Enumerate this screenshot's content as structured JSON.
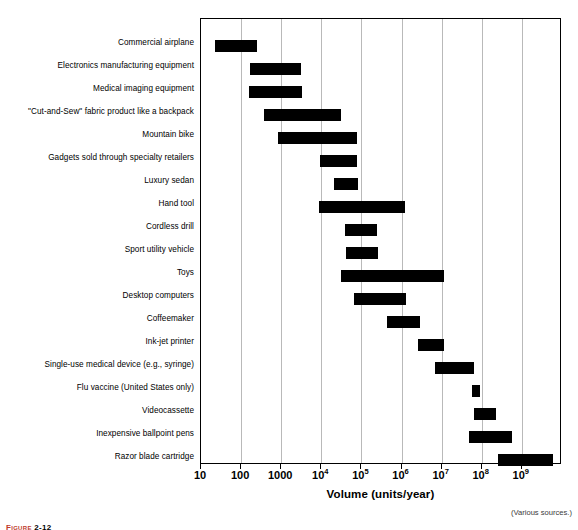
{
  "chart_data": {
    "type": "bar",
    "orientation": "horizontal",
    "subtype": "range-bar",
    "title": "",
    "xlabel": "Volume (units/year)",
    "ylabel": "",
    "xscale": "log",
    "xlim": [
      10,
      3000000000
    ],
    "grid": "vertical-gridlines-at-decades",
    "legend": "none",
    "annotations": [
      "(Various sources.)"
    ],
    "xticks": [
      {
        "value": 10,
        "label": "10",
        "exp": null
      },
      {
        "value": 100,
        "label": "100",
        "exp": null
      },
      {
        "value": 1000,
        "label": "1000",
        "exp": null
      },
      {
        "value": 10000,
        "label": "10",
        "exp": "4"
      },
      {
        "value": 100000,
        "label": "10",
        "exp": "5"
      },
      {
        "value": 1000000,
        "label": "10",
        "exp": "6"
      },
      {
        "value": 10000000,
        "label": "10",
        "exp": "7"
      },
      {
        "value": 100000000,
        "label": "10",
        "exp": "8"
      },
      {
        "value": 1000000000,
        "label": "10",
        "exp": "9"
      }
    ],
    "categories": [
      "Commercial airplane",
      "Electronics manufacturing equipment",
      "Medical imaging equipment",
      "\"Cut-and-Sew\" fabric product like a backpack",
      "Mountain bike",
      "Gadgets sold through specialty retailers",
      "Luxury sedan",
      "Hand tool",
      "Cordless drill",
      "Sport utility vehicle",
      "Toys",
      "Desktop computers",
      "Coffeemaker",
      "Ink-jet printer",
      "Single-use medical device (e.g., syringe)",
      "Flu vaccine (United States only)",
      "Videocassette",
      "Inexpensive ballpoint pens",
      "Razor blade cartridge"
    ],
    "ranges": [
      {
        "label": "Commercial airplane",
        "low": 22,
        "high": 220
      },
      {
        "label": "Electronics manufacturing equipment",
        "low": 270,
        "high": 2200
      },
      {
        "label": "Medical imaging equipment",
        "low": 260,
        "high": 2300
      },
      {
        "label": "\"Cut-and-Sew\" fabric product like a backpack",
        "low": 460,
        "high": 26000
      },
      {
        "label": "Mountain bike",
        "low": 1100,
        "high": 62000
      },
      {
        "label": "Gadgets sold through specialty retailers",
        "low": 13000,
        "high": 110000
      },
      {
        "label": "Luxury sedan",
        "low": 28000,
        "high": 62000
      },
      {
        "label": "Hand tool",
        "low": 11000,
        "high": 1100000
      },
      {
        "label": "Cordless drill",
        "low": 55000,
        "high": 330000
      },
      {
        "label": "Sport utility vehicle",
        "low": 60000,
        "high": 340000
      },
      {
        "label": "Toys",
        "low": 40000,
        "high": 11000000
      },
      {
        "label": "Desktop computers",
        "low": 65000,
        "high": 800000
      },
      {
        "label": "Coffeemaker",
        "low": 420000,
        "high": 2700000
      },
      {
        "label": "Ink-jet printer",
        "low": 2300000,
        "high": 9500000
      },
      {
        "label": "Single-use medical device (e.g., syringe)",
        "low": 6500000,
        "high": 55000000
      },
      {
        "label": "Flu vaccine (United States only)",
        "low": 45000000,
        "high": 70000000
      },
      {
        "label": "Videocassette",
        "low": 65000000,
        "high": 220000000
      },
      {
        "label": "Inexpensive ballpoint pens",
        "low": 48000000,
        "high": 520000000
      },
      {
        "label": "Razor blade cartridge",
        "low": 230000000,
        "high": 1800000000
      }
    ],
    "bar_pixels": [
      {
        "x0": 214,
        "x1": 256,
        "y": 39
      },
      {
        "x0": 249,
        "x1": 300,
        "y": 62
      },
      {
        "x0": 248,
        "x1": 301,
        "y": 85
      },
      {
        "x0": 263,
        "x1": 340,
        "y": 108
      },
      {
        "x0": 277,
        "x1": 356,
        "y": 131
      },
      {
        "x0": 319,
        "x1": 356,
        "y": 154
      },
      {
        "x0": 333,
        "x1": 357,
        "y": 177
      },
      {
        "x0": 318,
        "x1": 404,
        "y": 200
      },
      {
        "x0": 344,
        "x1": 376,
        "y": 223
      },
      {
        "x0": 345,
        "x1": 377,
        "y": 246
      },
      {
        "x0": 340,
        "x1": 443,
        "y": 269
      },
      {
        "x0": 353,
        "x1": 405,
        "y": 292
      },
      {
        "x0": 386,
        "x1": 419,
        "y": 315
      },
      {
        "x0": 417,
        "x1": 443,
        "y": 338
      },
      {
        "x0": 434,
        "x1": 473,
        "y": 361
      },
      {
        "x0": 471,
        "x1": 479,
        "y": 384
      },
      {
        "x0": 473,
        "x1": 495,
        "y": 407
      },
      {
        "x0": 468,
        "x1": 511,
        "y": 430
      },
      {
        "x0": 497,
        "x1": 552,
        "y": 453
      }
    ],
    "plot_area_pixels": {
      "left": 200,
      "top": 18,
      "width": 361,
      "height": 446
    },
    "axis_pixels": {
      "x_at_10": 200,
      "px_per_decade": 40.1
    }
  },
  "axis": {
    "title": "Volume (units/year)"
  },
  "source_note": "(Various sources.)",
  "figure_caption": {
    "label": "Figure",
    "number": "2-12"
  },
  "colors": {
    "bar": "#000000",
    "gridline": "#b9b9b9",
    "frame": "#000000",
    "text": "#000000",
    "note": "#3a3a3a"
  }
}
